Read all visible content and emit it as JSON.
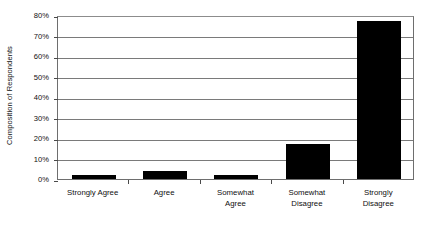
{
  "chart_data": {
    "type": "bar",
    "title": "",
    "subtitle": "",
    "xlabel": "",
    "ylabel": "Composition of Respondents",
    "categories": [
      "Strongly Agree",
      "Agree",
      "Somewhat\nAgree",
      "Somewhat\nDisagree",
      "Strongly\nDisagree"
    ],
    "values": [
      2,
      4,
      2,
      17,
      77
    ],
    "ylim": [
      0,
      80
    ],
    "y_ticks": [
      0,
      10,
      20,
      30,
      40,
      50,
      60,
      70,
      80
    ],
    "y_tick_labels": [
      "0%",
      "10%",
      "20%",
      "30%",
      "40%",
      "50%",
      "60%",
      "70%",
      "80%"
    ],
    "grid": true,
    "legend": false,
    "legend_position": "none",
    "bar_color": "#000000",
    "gridline_color": "#7a7a7a",
    "axis_color": "#6e6e6e",
    "plot_background": "#ffffff"
  }
}
